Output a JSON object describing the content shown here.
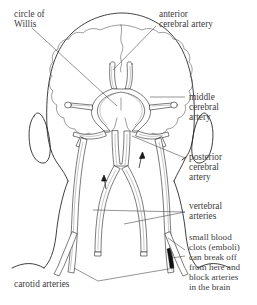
{
  "figure": {
    "background_color": "#ffffff",
    "ink_color": "#1d1d1d",
    "label_color": "#40403e",
    "leader_color": "#3a3a3a"
  },
  "labels": {
    "circle_of_willis": {
      "lines": [
        "circle of",
        "Willis"
      ],
      "line1": "circle of",
      "line2": "Willis",
      "x": 14,
      "y": 14,
      "align": "left"
    },
    "anterior_cerebral_artery": {
      "lines": [
        "anterior",
        "cerebral artery"
      ],
      "line1": "anterior",
      "line2": "cerebral artery",
      "x": 159,
      "y": 14,
      "align": "left"
    },
    "middle_cerebral_artery": {
      "lines": [
        "middle",
        "cerebral",
        "artery"
      ],
      "line1": "middle",
      "line2": "cerebral",
      "line3": "artery",
      "x": 188,
      "y": 95,
      "align": "left"
    },
    "posterior_cerebral_artery": {
      "lines": [
        "posterior",
        "cerebral",
        "artery"
      ],
      "line1": "posterior",
      "line2": "cerebral",
      "line3": "artery",
      "x": 188,
      "y": 156,
      "align": "left"
    },
    "vertebral_arteries": {
      "lines": [
        "vertebral",
        "arteries"
      ],
      "line1": "vertebral",
      "line2": "arteries",
      "x": 188,
      "y": 206,
      "align": "left"
    },
    "emboli_note": {
      "lines": [
        "small blood",
        "clots (emboli)",
        "can break off",
        "from here and",
        "block arteries",
        "in the brain"
      ],
      "line1": "small blood",
      "line2": "clots (emboli)",
      "line3": "can break off",
      "line4": "from here and",
      "line5": "block arteries",
      "line6": "in the brain",
      "x": 188,
      "y": 236,
      "align": "left"
    },
    "carotid_arteries": {
      "lines": [
        "carotid arteries"
      ],
      "line1": "carotid arteries",
      "x": 14,
      "y": 284,
      "align": "left"
    }
  },
  "anatomy": {
    "skull_outline": "cranium and jaw seen from behind",
    "brain_hemispheres": "two lobed cerebral hemispheres with scalloped edges",
    "left_ear": "left auricle",
    "right_ear": "right auricle",
    "neck": "posterior neck and shoulders",
    "circle_of_willis_ring": "hexagonal anastomotic arterial ring at base of brain",
    "anterior_cerebral_pair": "two vertical vessels rising from top of the ring",
    "middle_cerebral_pair": "lateral stubs with terminal bulbs on both sides of the ring",
    "posterior_cerebral_pair": "vessels descending laterally from the lower ring",
    "basilar_artery": "single midline trunk below the ring",
    "vertebral_arteries": "paired vessels forming an inverted V that merge into the basilar artery",
    "carotid_arteries": "paired vessels ascending from the lower neck",
    "flow_arrows": 2,
    "embolus_marker": "dark clot at right carotid origin"
  }
}
